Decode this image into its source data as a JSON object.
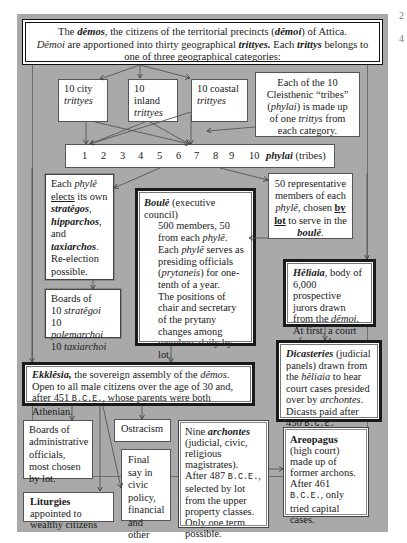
{
  "diagram": {
    "title_box": {
      "line1_pre": "The ",
      "line1_demos": "dêmos",
      "line1_mid": ", the citizens of the territorial precincts (",
      "line1_demoi": "dêmoi",
      "line1_post": ") of Attica.",
      "line2_demoi": "Dêmoi",
      "line2_mid": " are apportioned into thirty geographical ",
      "line2_trittyes": "trittyes.",
      "line2_each": "  Each ",
      "line2_trittys": "trittys",
      "line2_post": " belongs to one of three geographical categories:"
    },
    "trittyes": [
      {
        "label": "10 city",
        "term": "trittyes"
      },
      {
        "label": "10 inland",
        "term": "trittyes"
      },
      {
        "label": "10 coastal",
        "term": "trittyes"
      }
    ],
    "tribes_note": {
      "pre": "Each of the 10 Cleisthenic “tribes” (",
      "phylai": "phylai",
      "mid": ") is made up of one ",
      "trittys": "trittys",
      "post": " from each category."
    },
    "phylai_row": {
      "numbers": [
        "1",
        "2",
        "3",
        "4",
        "5",
        "6",
        "7",
        "8",
        "9",
        "10"
      ],
      "label": "phylai",
      "label_suffix": " (tribes)"
    },
    "phyle_elects": {
      "each": "Each ",
      "phyle": "phylê",
      "elects": "elects",
      "its_own": " its own",
      "strategos": "stratêgos",
      "hipparchos": "hipparchos",
      "and": "and",
      "taxiarchos": "taxiarchos",
      "reelection": "Re-election possible."
    },
    "boards_military": {
      "title": "Boards of",
      "items": [
        {
          "count": "10 ",
          "term": "stratêgoi"
        },
        {
          "count": "10 ",
          "term": "polemarchoi"
        },
        {
          "count": "10 ",
          "term": "taxiarchoi"
        }
      ]
    },
    "boule": {
      "title": "Boulê",
      "title_suffix": " (executive council)",
      "line1": "500 members, 50 from each ",
      "line1_phyle": "phylê",
      "line1_end": ".",
      "line2_pre": "Each ",
      "line2_phyle": "phylê",
      "line2_mid": " serves as presiding officials (",
      "line2_prytaneis": "prytaneis",
      "line2_post": ") for one-tenth of a year.",
      "line3": "The positions of chair and secretary of the prytany changes among members daily by lot.",
      "line4_pre": "Prepares agenda and proposals for the ",
      "line4_ekklesia": "ekklêsia",
      "line4_end": "."
    },
    "representatives": {
      "pre": "50 representative members of each ",
      "phyle": "phylê",
      "mid": ", chosen ",
      "by_lot": "by lot",
      "mid2": " to serve in the ",
      "boule": "boulê",
      "end": "."
    },
    "heliaia": {
      "title": "Hêliaia",
      "text_pre": ", body of 6,000 prospective jurors drawn from the ",
      "demoi": "dêmoi",
      "text_post": ". At first, a court of appeals."
    },
    "dicasteries": {
      "title": "Dicasteries",
      "text1": " (judicial panels) drawn from the ",
      "heliaia": "hêliaia",
      "text2": " to hear court cases presided over by ",
      "archontes": "archontes",
      "text3": ". Dicasts paid after 450 ",
      "bce": "B.C.E."
    },
    "ekklesia": {
      "title": "Ekklêsia,",
      "text1": " the sovereign assembly of the ",
      "demos": "dêmos",
      "text2": ".  Open to all male citizens over the age of 30 and, after 451 ",
      "bce": "B.C.E.",
      "text3": ", whose parents were both Athenian."
    },
    "boards_admin": {
      "text": "Boards of administrative officials, most chosen by lot."
    },
    "ostracism": {
      "text": "Ostracism"
    },
    "final_say": {
      "text": "Final say in civic policy, financial and other decisions."
    },
    "liturgies": {
      "title": "Liturgies",
      "text": " appointed to wealthy citizens"
    },
    "archons": {
      "pre": "Nine ",
      "archontes": "archontes",
      "text1": " (judicial, civic, religious magistrates). After 487 ",
      "bce": "B.C.E.",
      "text2": ", selected by lot from the upper property classes.  Only one term possible."
    },
    "areopagus": {
      "title": "Areopagus",
      "text1": " (high court) made up of former archons. After 461 ",
      "bce": "B.C.E.",
      "text2": ", only tried capital cases."
    },
    "margin_marks": [
      "2",
      "4"
    ]
  }
}
